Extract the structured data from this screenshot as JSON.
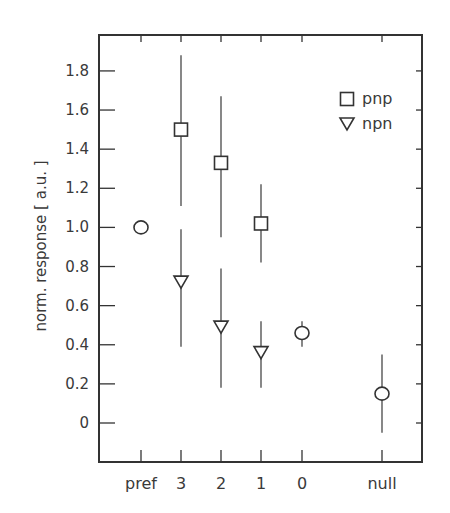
{
  "chart_data": {
    "type": "scatter",
    "title": "",
    "xlabel": "",
    "ylabel": "norm. response  [ a.u. ]",
    "ylim": [
      -0.2,
      2.0
    ],
    "yticks": [
      0,
      0.2,
      0.4,
      0.6,
      0.8,
      1.0,
      1.2,
      1.4,
      1.6,
      1.8
    ],
    "ytick_labels": [
      "0",
      "0.2",
      "0.4",
      "0.6",
      "0.8",
      "1.0",
      "1.2",
      "1.4",
      "1.6",
      "1.8"
    ],
    "categories": [
      "pref",
      "3",
      "2",
      "1",
      "0",
      "null"
    ],
    "grid": false,
    "legend_position": "upper right",
    "series": [
      {
        "name": "pnp",
        "marker": "square",
        "points": [
          {
            "x": "3",
            "y": 1.5,
            "y_low": 1.11,
            "y_high": 1.88
          },
          {
            "x": "2",
            "y": 1.33,
            "y_low": 0.95,
            "y_high": 1.67
          },
          {
            "x": "1",
            "y": 1.02,
            "y_low": 0.82,
            "y_high": 1.22
          }
        ]
      },
      {
        "name": "npn",
        "marker": "triangle-down",
        "points": [
          {
            "x": "3",
            "y": 0.72,
            "y_low": 0.39,
            "y_high": 0.99
          },
          {
            "x": "2",
            "y": 0.49,
            "y_low": 0.18,
            "y_high": 0.79
          },
          {
            "x": "1",
            "y": 0.36,
            "y_low": 0.18,
            "y_high": 0.52
          }
        ]
      },
      {
        "name": "reference",
        "marker": "circle",
        "in_legend": false,
        "points": [
          {
            "x": "pref",
            "y": 1.0,
            "y_low": null,
            "y_high": null
          },
          {
            "x": "0",
            "y": 0.46,
            "y_low": 0.39,
            "y_high": 0.52
          },
          {
            "x": "null",
            "y": 0.15,
            "y_low": -0.05,
            "y_high": 0.35
          }
        ]
      }
    ],
    "legend": [
      {
        "label": "pnp",
        "marker": "square"
      },
      {
        "label": "npn",
        "marker": "triangle-down"
      }
    ]
  }
}
